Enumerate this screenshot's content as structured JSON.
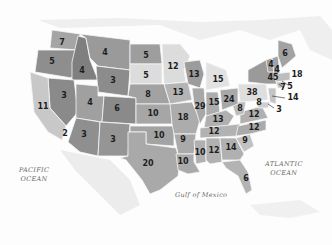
{
  "map": {
    "title": "US Electoral Votes by State",
    "colors": {
      "dark": "#8f8f8f",
      "mid": "#a8a8a8",
      "light": "#d6d6d6",
      "border": "#f4f4f4",
      "land": "#e8e8e8",
      "text": "#1e1e1e"
    },
    "water_labels": [
      {
        "id": "pacific",
        "line1": "PACIFIC",
        "line2": "OCEAN",
        "x": 19,
        "y": 166
      },
      {
        "id": "atlantic",
        "line1": "ATLANTIC",
        "line2": "OCEAN",
        "x": 285,
        "y": 160
      },
      {
        "id": "gulf",
        "line1": "Gulf of Mexico",
        "line2": "",
        "x": 201,
        "y": 194
      }
    ],
    "states": [
      {
        "abbr": "WA",
        "votes": "7",
        "x": 62,
        "y": 43
      },
      {
        "abbr": "OR",
        "votes": "5",
        "x": 52,
        "y": 62
      },
      {
        "abbr": "ID",
        "votes": "4",
        "x": 82,
        "y": 71
      },
      {
        "abbr": "MT",
        "votes": "4",
        "x": 105,
        "y": 53
      },
      {
        "abbr": "WY",
        "votes": "3",
        "x": 113,
        "y": 81
      },
      {
        "abbr": "NV",
        "votes": "3",
        "x": 64,
        "y": 96
      },
      {
        "abbr": "UT",
        "votes": "4",
        "x": 90,
        "y": 103
      },
      {
        "abbr": "CO",
        "votes": "6",
        "x": 117,
        "y": 109
      },
      {
        "abbr": "CA",
        "votes": "11",
        "x": 43,
        "y": 107
      },
      {
        "abbr": "AZ",
        "votes": "3",
        "x": 84,
        "y": 135
      },
      {
        "abbr": "NM",
        "votes": "3",
        "x": 113,
        "y": 140
      },
      {
        "abbr": "SoCal",
        "votes": "2",
        "x": 65,
        "y": 134
      },
      {
        "abbr": "ND",
        "votes": "5",
        "x": 146,
        "y": 56
      },
      {
        "abbr": "SD",
        "votes": "5",
        "x": 146,
        "y": 76
      },
      {
        "abbr": "NE",
        "votes": "8",
        "x": 148,
        "y": 95
      },
      {
        "abbr": "KS",
        "votes": "10",
        "x": 153,
        "y": 114
      },
      {
        "abbr": "OK",
        "votes": "10",
        "x": 159,
        "y": 136
      },
      {
        "abbr": "TX",
        "votes": "20",
        "x": 148,
        "y": 164
      },
      {
        "abbr": "MN",
        "votes": "12",
        "x": 173,
        "y": 67
      },
      {
        "abbr": "IA",
        "votes": "13",
        "x": 178,
        "y": 93
      },
      {
        "abbr": "MO",
        "votes": "18",
        "x": 183,
        "y": 118
      },
      {
        "abbr": "AR",
        "votes": "9",
        "x": 183,
        "y": 140
      },
      {
        "abbr": "LA",
        "votes": "10",
        "x": 183,
        "y": 162
      },
      {
        "abbr": "WI",
        "votes": "13",
        "x": 194,
        "y": 75
      },
      {
        "abbr": "IL",
        "votes": "29",
        "x": 200,
        "y": 107
      },
      {
        "abbr": "MS",
        "votes": "10",
        "x": 200,
        "y": 153
      },
      {
        "abbr": "MI",
        "votes": "15",
        "x": 218,
        "y": 80
      },
      {
        "abbr": "IN",
        "votes": "15",
        "x": 214,
        "y": 103
      },
      {
        "abbr": "KY",
        "votes": "13",
        "x": 218,
        "y": 120
      },
      {
        "abbr": "TN",
        "votes": "12",
        "x": 214,
        "y": 132
      },
      {
        "abbr": "AL",
        "votes": "12",
        "x": 214,
        "y": 151
      },
      {
        "abbr": "GA",
        "votes": "14",
        "x": 231,
        "y": 148
      },
      {
        "abbr": "FL",
        "votes": "6",
        "x": 246,
        "y": 179
      },
      {
        "abbr": "SC",
        "votes": "9",
        "x": 245,
        "y": 141
      },
      {
        "abbr": "NC",
        "votes": "12",
        "x": 254,
        "y": 128
      },
      {
        "abbr": "VA",
        "votes": "12",
        "x": 254,
        "y": 115
      },
      {
        "abbr": "WV",
        "votes": "8",
        "x": 240,
        "y": 109
      },
      {
        "abbr": "OH",
        "votes": "24",
        "x": 229,
        "y": 100
      },
      {
        "abbr": "PA",
        "votes": "38",
        "x": 252,
        "y": 93
      },
      {
        "abbr": "NY",
        "votes": "45",
        "x": 273,
        "y": 78
      },
      {
        "abbr": "VT",
        "votes": "4",
        "x": 271,
        "y": 65
      },
      {
        "abbr": "NH",
        "votes": "4",
        "x": 277,
        "y": 70
      },
      {
        "abbr": "ME",
        "votes": "6",
        "x": 285,
        "y": 54
      },
      {
        "abbr": "MA",
        "votes": "18",
        "x": 297,
        "y": 75
      },
      {
        "abbr": "RI",
        "votes": "5",
        "x": 290,
        "y": 87
      },
      {
        "abbr": "CT",
        "votes": "7",
        "x": 283,
        "y": 88
      },
      {
        "abbr": "NJ",
        "votes": "14",
        "x": 293,
        "y": 98
      },
      {
        "abbr": "MD",
        "votes": "8",
        "x": 259,
        "y": 103
      },
      {
        "abbr": "DE",
        "votes": "3",
        "x": 279,
        "y": 110
      }
    ]
  }
}
